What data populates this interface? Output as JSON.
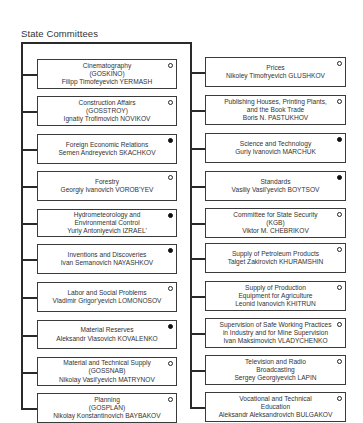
{
  "title": "State Committees",
  "left_column": [
    {
      "lines": [
        "Cinematography",
        "(GOSKINO)",
        "Filipp Timofeyevich YERMASH"
      ],
      "indicator": "open"
    },
    {
      "lines": [
        "Construction Affairs",
        "(GOSSTROY)",
        "Ignatiy Trofimovich NOVIKOV"
      ],
      "indicator": "open"
    },
    {
      "lines": [
        "Foreign Economic Relations",
        "Semen Andreyevich SKACHKOV"
      ],
      "indicator": "filled"
    },
    {
      "lines": [
        "Forestry",
        "Georgiy Ivanovich VOROB'YEV"
      ],
      "indicator": "open"
    },
    {
      "lines": [
        "Hydrometeorology and",
        "Environmental Control",
        "Yuriy Antoniyevich IZRAEL'"
      ],
      "indicator": "filled"
    },
    {
      "lines": [
        "Inventions and Discoveries",
        "Ivan Semanovich NAYASHKOV"
      ],
      "indicator": "filled"
    },
    {
      "lines": [
        "Labor and Social Problems",
        "Vladimir Grigor'yevich LOMONOSOV"
      ],
      "indicator": "open"
    },
    {
      "lines": [
        "Material Reserves",
        "Aleksandr Vlasovich KOVALENKO"
      ],
      "indicator": "filled"
    },
    {
      "lines": [
        "Material and Technical Supply",
        "(GOSSNAB)",
        "Nikolay Vasil'yevich MATRYNOV"
      ],
      "indicator": "open"
    },
    {
      "lines": [
        "Planning",
        "(GOSPLAN)",
        "Nikolay Konstantinovich BAYBAKOV"
      ],
      "indicator": "open"
    }
  ],
  "right_column": [
    {
      "lines": [
        "Prices",
        "Nikoley Timofryevich GLUSHKOV"
      ],
      "indicator": "open"
    },
    {
      "lines": [
        "Publishing Houses, Printing Plants,",
        "and the Book Trade",
        "Boris N. PASTUKHOV"
      ],
      "indicator": "open"
    },
    {
      "lines": [
        "Science and Technology",
        "Guriy Ivanovich MARCHUK"
      ],
      "indicator": "filled"
    },
    {
      "lines": [
        "Standards",
        "Vasiliy Vasil'yevich BOYTSOV"
      ],
      "indicator": "filled"
    },
    {
      "lines": [
        "Committee for State Security",
        "(KGB)",
        "Viktor M. CHEBRIKOV"
      ],
      "indicator": "open"
    },
    {
      "lines": [
        "Supply of Petroleum Products",
        "Talget Zakirovich KHURAMSHIN"
      ],
      "indicator": "open"
    },
    {
      "lines": [
        "Supply of Production",
        "Equipment for Agriculture",
        "Leonid Ivanovich KHITRUN"
      ],
      "indicator": "open"
    },
    {
      "lines": [
        "Supervision of Safe Working Practices",
        "in Industry and for Mine Supervision",
        "Ivan Maksimovich VLADYCHENKO"
      ],
      "indicator": "open"
    },
    {
      "lines": [
        "Television and Radio",
        "Broadcasting",
        "Sergey Georgiyevich LAPIN"
      ],
      "indicator": "open"
    },
    {
      "lines": [
        "Vocational and Technical",
        "Education",
        "Aleksandr Aleksandrovich BULGAKOV"
      ],
      "indicator": "open"
    }
  ],
  "colors": {
    "line": "#2a2a2a",
    "text": "#333333",
    "filled_indicator": "#111111"
  }
}
